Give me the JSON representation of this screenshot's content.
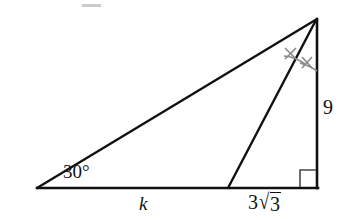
{
  "figure": {
    "type": "geometry-diagram",
    "background_color": "#ffffff",
    "stroke_color": "#111111",
    "mark_color": "#8c8c8c",
    "labels": {
      "base_angle": "30°",
      "left_base_segment": "k",
      "right_base_segment_coefficient": "3",
      "right_base_segment_radicand": "3",
      "right_base_segment": "3√3",
      "vertical_side": "9"
    },
    "marks": {
      "right_angle_symbol": "right-angle-square",
      "congruent_angle_ticks": 2,
      "tick_glyph": "x"
    },
    "points": {
      "left_vertex": [
        37,
        188
      ],
      "apex": [
        317,
        19
      ],
      "bottom_right_vertex": [
        317,
        188
      ],
      "cevian_foot": [
        228,
        188
      ]
    },
    "artifact": {
      "name": "top-dash",
      "color": "#b9b9b9",
      "rect": [
        82,
        4,
        19,
        3
      ]
    }
  }
}
